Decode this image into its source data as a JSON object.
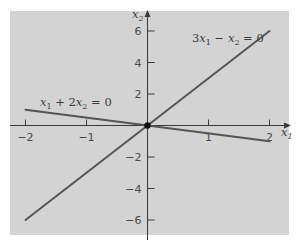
{
  "diagram": {
    "type": "coordinate-plane",
    "background_color": "#d3d3d3",
    "line_color": "#555555",
    "axes": {
      "x_label": "x",
      "x_label_sub": "1",
      "y_label": "x",
      "y_label_sub": "2",
      "x_ticks": [
        {
          "value": -2,
          "label": "−2"
        },
        {
          "value": -1,
          "label": "−1"
        },
        {
          "value": 1,
          "label": "1"
        },
        {
          "value": 2,
          "label": "2"
        }
      ],
      "y_ticks": [
        {
          "value": 6,
          "label": "6"
        },
        {
          "value": 4,
          "label": "4"
        },
        {
          "value": 2,
          "label": "2"
        },
        {
          "value": -2,
          "label": "−2"
        },
        {
          "value": -4,
          "label": "−4"
        },
        {
          "value": -6,
          "label": "−6"
        }
      ]
    },
    "lines": [
      {
        "name": "line-3x1-minus-x2",
        "equation": "3x1 − x2 = 0",
        "label_parts": [
          "3",
          "x",
          "1",
          " − ",
          "x",
          "2",
          " = 0"
        ],
        "from": [
          -2,
          -6
        ],
        "to": [
          2,
          6
        ]
      },
      {
        "name": "line-x1-plus-2x2",
        "equation": "x1 + 2x2 = 0",
        "label_parts": [
          "",
          "x",
          "1",
          " + 2",
          "x",
          "2",
          " = 0"
        ],
        "from": [
          -2,
          1
        ],
        "to": [
          2,
          -1
        ]
      }
    ],
    "intersection_point": {
      "x": 0,
      "y": 0
    }
  }
}
